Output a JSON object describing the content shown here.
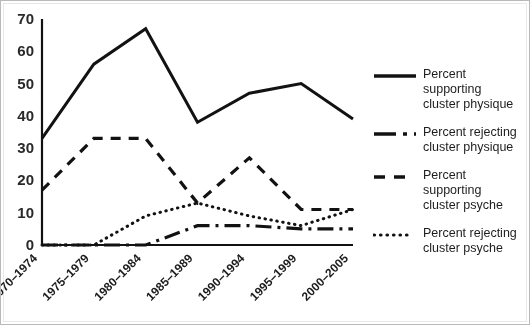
{
  "chart_data": {
    "type": "line",
    "title": "",
    "xlabel": "",
    "ylabel": "",
    "ylim": [
      0,
      70
    ],
    "yticks": [
      0,
      10,
      20,
      30,
      40,
      50,
      60,
      70
    ],
    "grid": false,
    "legend_position": "right",
    "categories": [
      "1970–1974",
      "1975–1979",
      "1980–1984",
      "1985–1989",
      "1990–1994",
      "1995–1999",
      "2000–2005"
    ],
    "series": [
      {
        "name": "Percent supporting cluster physique",
        "style": "solid",
        "values": [
          33,
          56,
          67,
          38,
          47,
          50,
          39
        ]
      },
      {
        "name": "Percent rejecting cluster physique",
        "style": "long-dash-dot",
        "values": [
          0,
          0,
          0,
          6,
          6,
          5,
          5
        ]
      },
      {
        "name": "Percent supporting cluster psyche",
        "style": "dashed",
        "values": [
          17,
          33,
          33,
          13,
          27,
          11,
          11
        ]
      },
      {
        "name": "Percent rejecting cluster psyche",
        "style": "dotted",
        "values": [
          0,
          0,
          9,
          13,
          9,
          6,
          11
        ]
      }
    ]
  },
  "axis": {
    "ytick_labels": [
      "70",
      "60",
      "50",
      "40",
      "30",
      "20",
      "10",
      "0"
    ],
    "xtick_labels": [
      "1970–1974",
      "1975–1979",
      "1980–1984",
      "1985–1989",
      "1990–1994",
      "1995–1999",
      "2000–2005"
    ]
  },
  "legend": {
    "items": [
      {
        "line1": "Percent supporting",
        "line2": "cluster physique",
        "style": "solid"
      },
      {
        "line1": "Percent rejecting",
        "line2": "cluster physique",
        "style": "long-dash-dot"
      },
      {
        "line1": "Percent supporting",
        "line2": "cluster psyche",
        "style": "dashed"
      },
      {
        "line1": "Percent rejecting",
        "line2": "cluster psyche",
        "style": "dotted"
      }
    ]
  },
  "colors": {
    "line": "#141414",
    "axis": "#141414",
    "text": "#1f1f1f",
    "border": "#b8b8b8",
    "background": "#fdfdfd"
  }
}
